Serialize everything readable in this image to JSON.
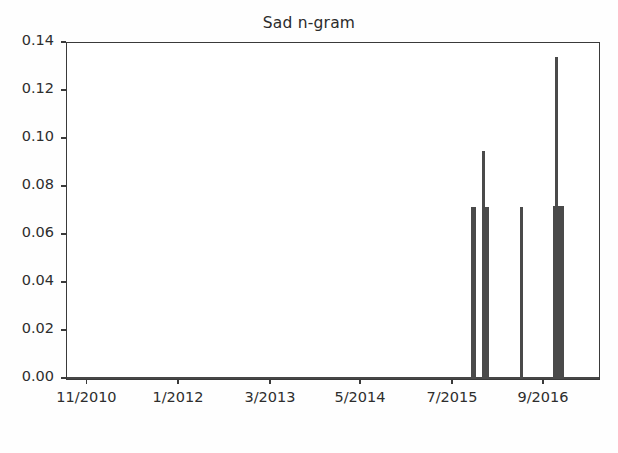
{
  "chart_data": {
    "type": "bar",
    "title": "Sad n-gram",
    "xlabel": "",
    "ylabel": "",
    "ylim": [
      0.0,
      0.14
    ],
    "yticks": [
      0.0,
      0.02,
      0.04,
      0.06,
      0.08,
      0.1,
      0.12,
      0.14
    ],
    "ytick_labels": [
      "0.00",
      "0.02",
      "0.04",
      "0.06",
      "0.08",
      "0.10",
      "0.12",
      "0.14"
    ],
    "xtick_labels": [
      "11/2010",
      "1/2012",
      "3/2013",
      "5/2014",
      "7/2015",
      "9/2016"
    ],
    "xtick_positions": [
      0.0385,
      0.2105,
      0.3835,
      0.5526,
      0.7256,
      0.8966
    ],
    "grid": false,
    "legend": null,
    "xlim_description": "11/2010 through late 2016, monthly n-gram frequency",
    "series": [
      {
        "name": "Sad n-gram frequency",
        "color": "#4a4a4a",
        "baseline_value": 0.0,
        "points": [
          {
            "x_fraction": 0.765,
            "value": 0.0715,
            "width_px": 5
          },
          {
            "x_fraction": 0.782,
            "value": 0.095,
            "width_px": 3
          },
          {
            "x_fraction": 0.788,
            "value": 0.0715,
            "width_px": 5
          },
          {
            "x_fraction": 0.854,
            "value": 0.0715,
            "width_px": 3
          },
          {
            "x_fraction": 0.921,
            "value": 0.134,
            "width_px": 3
          },
          {
            "x_fraction": 0.9245,
            "value": 0.072,
            "width_px": 11
          }
        ]
      }
    ]
  },
  "colors": {
    "axis": "#3a3a3a",
    "series": "#4a4a4a",
    "text": "#2d2d2d",
    "background": "#ffffff"
  }
}
